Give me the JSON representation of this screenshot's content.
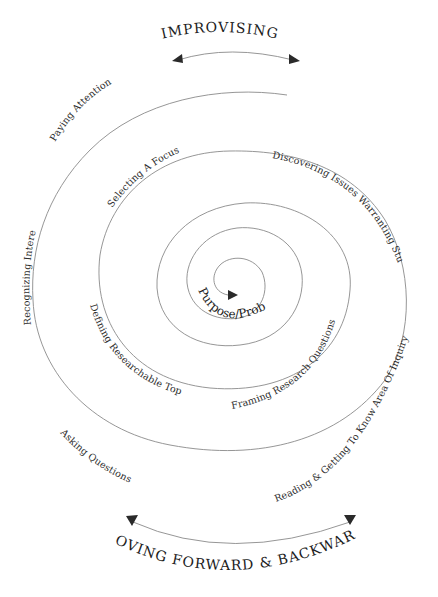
{
  "diagram": {
    "top_caption": "IMPROVISING",
    "bottom_caption": "MOVING FORWARD & BACKWARD",
    "center_label": "Purpose/Problem",
    "stages": [
      {
        "id": "paying-attention",
        "label": "Paying Attention"
      },
      {
        "id": "recognizing-interests",
        "label": "Recognizing Interests"
      },
      {
        "id": "asking-questions",
        "label": "Asking Questions"
      },
      {
        "id": "reading-getting-to-know",
        "label": "Reading & Getting To Know Area Of Inquiry"
      },
      {
        "id": "discovering-issues",
        "label": "Discovering Issues Warranting Study"
      },
      {
        "id": "selecting-a-focus",
        "label": "Selecting A Focus"
      },
      {
        "id": "defining-researchable-topics",
        "label": "Defining Researchable Topics"
      },
      {
        "id": "framing-research-questions",
        "label": "Framing Research Questions"
      }
    ],
    "colors": {
      "line": "#8a8a8a",
      "text": "#2c2c2c",
      "arrowhead": "#2a2a2a",
      "background": "#ffffff"
    }
  }
}
